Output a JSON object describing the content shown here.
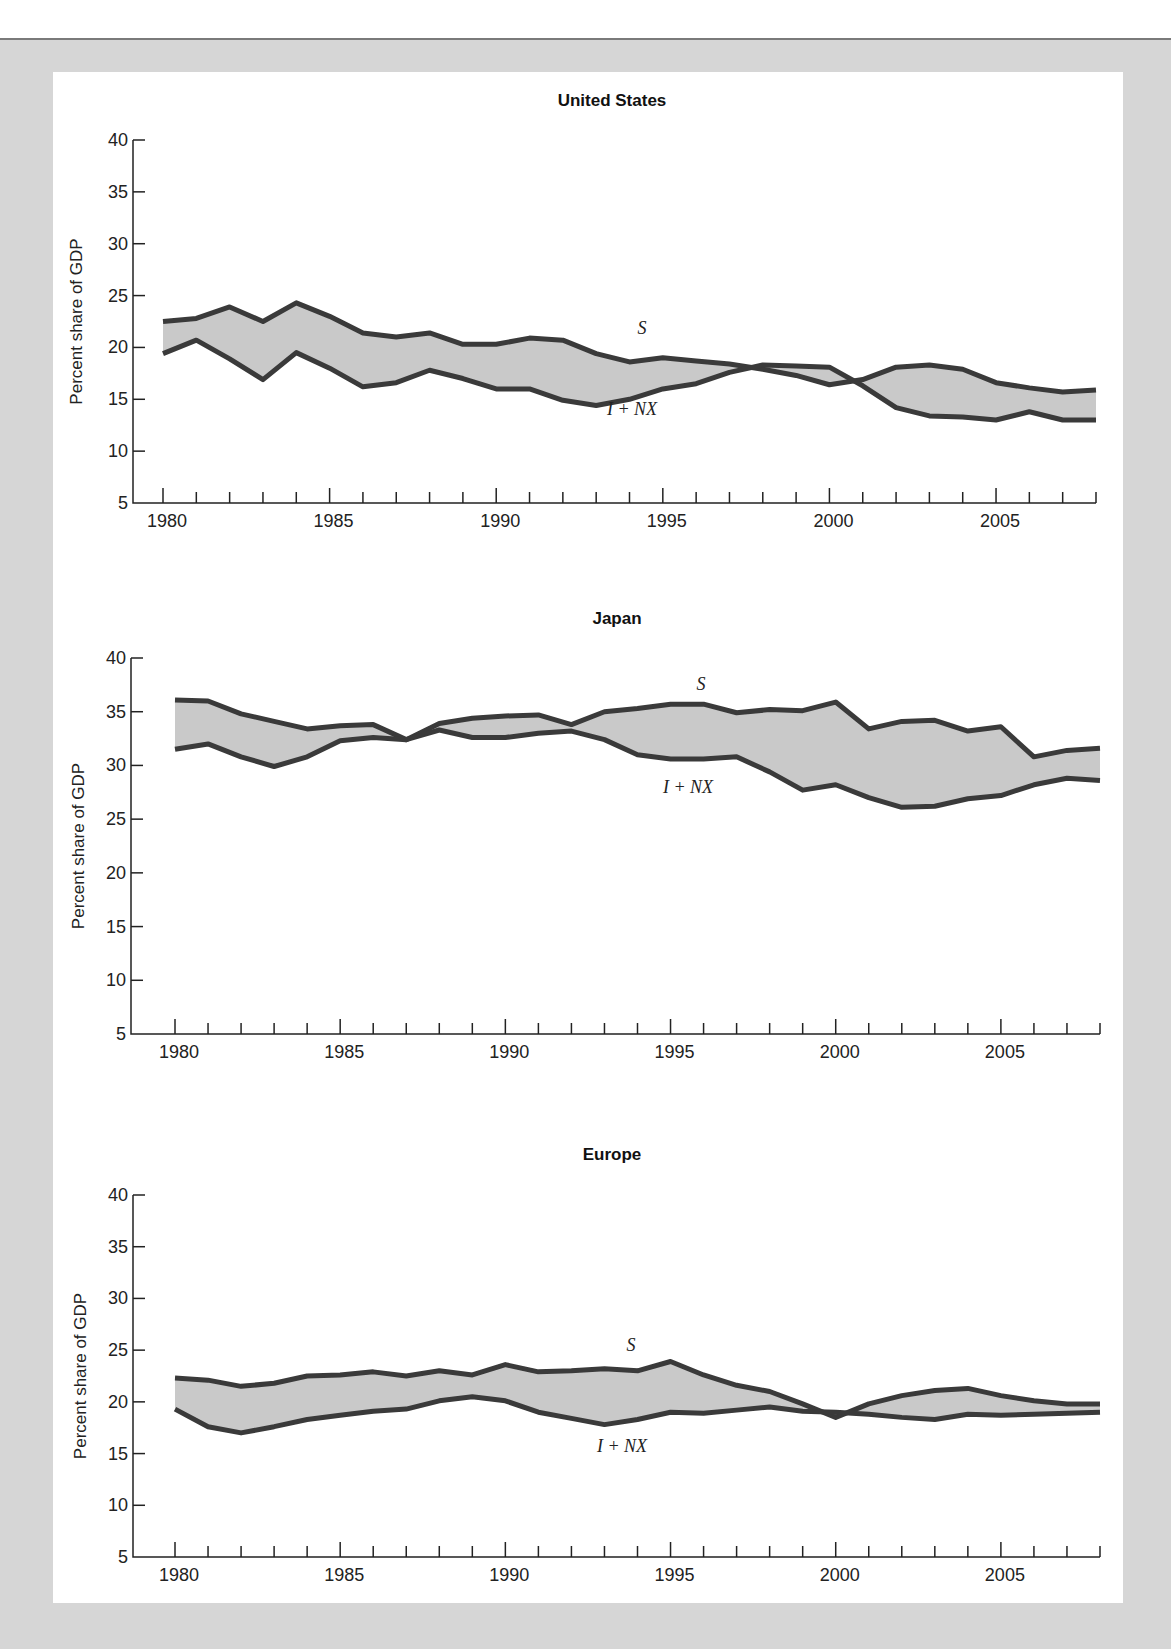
{
  "page": {
    "background": "#d6d6d6",
    "panel_background": "#ffffff",
    "band_color": "#c9c9c9",
    "line_color": "#3a3a3a"
  },
  "charts": [
    {
      "id": "us",
      "title": "United States",
      "ylabel": "Percent share of GDP",
      "series_labels": {
        "s": "S",
        "inx": "I + NX"
      }
    },
    {
      "id": "japan",
      "title": "Japan",
      "ylabel": "Percent share of GDP",
      "series_labels": {
        "s": "S",
        "inx": "I + NX"
      }
    },
    {
      "id": "europe",
      "title": "Europe",
      "ylabel": "Percent share of GDP",
      "series_labels": {
        "s": "S",
        "inx": "I + NX"
      }
    }
  ],
  "chart_data": [
    {
      "type": "line",
      "title": "United States",
      "xlabel": "",
      "ylabel": "Percent share of GDP",
      "ylim": [
        5,
        40
      ],
      "yticks": [
        5,
        10,
        15,
        20,
        25,
        30,
        35,
        40
      ],
      "xticks_labeled": [
        1980,
        1985,
        1990,
        1995,
        2000,
        2005
      ],
      "x": [
        1980,
        1981,
        1982,
        1983,
        1984,
        1985,
        1986,
        1987,
        1988,
        1989,
        1990,
        1991,
        1992,
        1993,
        1994,
        1995,
        1996,
        1997,
        1998,
        1999,
        2000,
        2001,
        2002,
        2003,
        2004,
        2005,
        2006,
        2007,
        2008
      ],
      "series": [
        {
          "name": "S",
          "values": [
            22.5,
            22.8,
            23.9,
            22.5,
            24.3,
            23.0,
            21.4,
            21.0,
            21.4,
            20.3,
            20.3,
            20.9,
            20.7,
            19.4,
            18.6,
            19.0,
            18.7,
            18.4,
            17.9,
            17.3,
            16.4,
            16.9,
            18.1,
            18.3,
            17.9,
            16.6,
            16.1,
            15.7,
            15.9
          ]
        },
        {
          "name": "I + NX",
          "values": [
            19.4,
            20.7,
            18.9,
            16.9,
            19.5,
            18.0,
            16.2,
            16.6,
            17.8,
            17.0,
            16.0,
            16.0,
            14.9,
            14.4,
            15.0,
            16.0,
            16.5,
            17.6,
            18.3,
            18.2,
            18.1,
            16.3,
            14.2,
            13.4,
            13.3,
            13.0,
            13.8,
            13.0,
            13.0
          ]
        }
      ],
      "fill_between": true,
      "grid": false,
      "legend": "inline labels"
    },
    {
      "type": "line",
      "title": "Japan",
      "xlabel": "",
      "ylabel": "Percent share of GDP",
      "ylim": [
        5,
        40
      ],
      "yticks": [
        5,
        10,
        15,
        20,
        25,
        30,
        35,
        40
      ],
      "xticks_labeled": [
        1980,
        1985,
        1990,
        1995,
        2000,
        2005
      ],
      "x": [
        1980,
        1981,
        1982,
        1983,
        1984,
        1985,
        1986,
        1987,
        1988,
        1989,
        1990,
        1991,
        1992,
        1993,
        1994,
        1995,
        1996,
        1997,
        1998,
        1999,
        2000,
        2001,
        2002,
        2003,
        2004,
        2005,
        2006,
        2007,
        2008
      ],
      "series": [
        {
          "name": "S",
          "values": [
            36.1,
            36.0,
            34.8,
            34.1,
            33.4,
            33.7,
            33.8,
            32.4,
            33.9,
            34.4,
            34.6,
            34.7,
            33.8,
            35.0,
            35.3,
            35.7,
            35.7,
            34.9,
            35.2,
            35.1,
            35.9,
            33.4,
            34.1,
            34.2,
            33.2,
            33.6,
            30.8,
            31.4,
            31.6
          ]
        },
        {
          "name": "I + NX",
          "values": [
            31.5,
            32.0,
            30.8,
            29.9,
            30.8,
            32.3,
            32.6,
            32.4,
            33.3,
            32.6,
            32.6,
            33.0,
            33.2,
            32.4,
            31.0,
            30.6,
            30.6,
            30.8,
            29.4,
            27.7,
            28.2,
            27.0,
            26.1,
            26.2,
            26.9,
            27.2,
            28.2,
            28.8,
            28.6
          ]
        }
      ],
      "fill_between": true,
      "grid": false,
      "legend": "inline labels"
    },
    {
      "type": "line",
      "title": "Europe",
      "xlabel": "",
      "ylabel": "Percent share of GDP",
      "ylim": [
        5,
        40
      ],
      "yticks": [
        5,
        10,
        15,
        20,
        25,
        30,
        35,
        40
      ],
      "xticks_labeled": [
        1980,
        1985,
        1990,
        1995,
        2000,
        2005
      ],
      "x": [
        1980,
        1981,
        1982,
        1983,
        1984,
        1985,
        1986,
        1987,
        1988,
        1989,
        1990,
        1991,
        1992,
        1993,
        1994,
        1995,
        1996,
        1997,
        1998,
        1999,
        2000,
        2001,
        2002,
        2003,
        2004,
        2005,
        2006,
        2007,
        2008
      ],
      "series": [
        {
          "name": "S",
          "values": [
            22.3,
            22.1,
            21.5,
            21.8,
            22.5,
            22.6,
            22.9,
            22.5,
            23.0,
            22.6,
            23.6,
            22.9,
            23.0,
            23.2,
            23.0,
            23.9,
            22.6,
            21.6,
            21.0,
            19.8,
            18.5,
            19.8,
            20.6,
            21.1,
            21.3,
            20.6,
            20.1,
            19.8,
            19.8
          ]
        },
        {
          "name": "I + NX",
          "values": [
            19.3,
            17.6,
            17.0,
            17.6,
            18.3,
            18.7,
            19.1,
            19.3,
            20.1,
            20.5,
            20.1,
            19.0,
            18.4,
            17.8,
            18.3,
            19.0,
            18.9,
            19.2,
            19.5,
            19.1,
            19.0,
            18.8,
            18.5,
            18.3,
            18.8,
            18.7,
            18.8,
            18.9,
            19.0
          ]
        }
      ],
      "fill_between": true,
      "grid": false,
      "legend": "inline labels"
    }
  ]
}
